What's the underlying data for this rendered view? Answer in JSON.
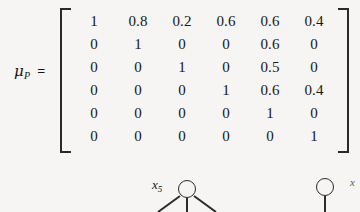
{
  "equation": {
    "lhs_symbol": "μ",
    "lhs_subscript": "P",
    "equals": "=",
    "matrix": [
      [
        "1",
        "0.8",
        "0.2",
        "0.6",
        "0.6",
        "0.4"
      ],
      [
        "0",
        "1",
        "0",
        "0",
        "0.6",
        "0"
      ],
      [
        "0",
        "0",
        "1",
        "0",
        "0.5",
        "0"
      ],
      [
        "0",
        "0",
        "0",
        "1",
        "0.6",
        "0.4"
      ],
      [
        "0",
        "0",
        "0",
        "0",
        "1",
        "0"
      ],
      [
        "0",
        "0",
        "0",
        "0",
        "0",
        "1"
      ]
    ],
    "rows": 6,
    "cols": 6,
    "bracket_left": "[",
    "bracket_right": "]"
  },
  "graph": {
    "nodes": [
      {
        "label_symbol": "x",
        "label_subscript": "5",
        "name": "x5"
      },
      {
        "label_symbol": "x",
        "label_subscript": "",
        "name": "right"
      }
    ],
    "partial_label": "x"
  },
  "colors": {
    "background": "#f6f5f3",
    "ink": "#1a1a1a",
    "stroke": "#2b2b2b"
  }
}
